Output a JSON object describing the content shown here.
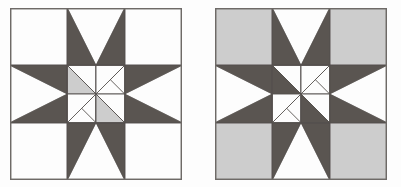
{
  "figure": {
    "type": "quilt-block-comparison",
    "background_color": "#fdfdfd",
    "width": 401,
    "height": 187
  },
  "palette": {
    "white": "#fdfdfd",
    "light_gray": "#cdcdcd",
    "dark_gray": "#5a5551",
    "line": "#56514e",
    "border": "#6e6a67"
  },
  "blocks": [
    {
      "name": "left-block",
      "label": "Star block on white background",
      "x": 10,
      "y": 8,
      "size": 172,
      "grid": 3,
      "background": "#fdfdfd",
      "star_color": "#5a5551",
      "center_color": "#cdcdcd",
      "corner_fill": "#fdfdfd",
      "edge_background": "#fdfdfd",
      "center_pinwheel": [
        "#cdcdcd",
        "#fdfdfd",
        "#fdfdfd",
        "#cdcdcd"
      ]
    },
    {
      "name": "right-block",
      "label": "Star block on light gray background",
      "x": 215,
      "y": 8,
      "size": 172,
      "grid": 3,
      "background": "#cdcdcd",
      "star_color": "#5a5551",
      "center_color": "#cdcdcd",
      "corner_fill": "#cdcdcd",
      "edge_background": "#fdfdfd",
      "center_pinwheel": [
        "#5a5551",
        "#fdfdfd",
        "#fdfdfd",
        "#5a5551"
      ]
    }
  ]
}
